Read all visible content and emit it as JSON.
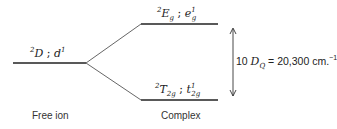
{
  "diagram": {
    "type": "crystal-field energy level splitting",
    "free_ion": {
      "term_label": {
        "multiplicity": "2",
        "term": "D",
        "separator": " ; ",
        "config": "d",
        "config_sup": "1"
      },
      "caption": "Free ion"
    },
    "complex": {
      "upper_level": {
        "multiplicity": "2",
        "term": "E",
        "term_sub": "g",
        "separator": " ; ",
        "config": "e",
        "config_sub": "g",
        "config_sup": "1"
      },
      "lower_level": {
        "multiplicity": "2",
        "term": "T",
        "term_sub": "2g",
        "separator": " ; ",
        "config": "t",
        "config_sub": "2g",
        "config_sup": "1"
      },
      "caption": "Complex"
    },
    "splitting": {
      "prefix": "10 ",
      "symbol": "D",
      "symbol_sub": "Q",
      "equals": " = 20,300 cm.",
      "unit_sup": "−1"
    },
    "colors": {
      "line": "#222222",
      "connector": "#555555"
    }
  }
}
